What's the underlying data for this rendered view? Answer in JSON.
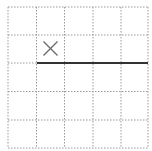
{
  "grid": {
    "rows": 5,
    "cols": 5,
    "x_lines": [
      8,
      36.5,
      64.5,
      93,
      121,
      148
    ],
    "y_lines": [
      7,
      35,
      63,
      91.5,
      120,
      148
    ],
    "line_color": "#999999",
    "dash": "1.5,1.5"
  },
  "marks": [
    {
      "type": "cross",
      "cx": 50.5,
      "cy": 48.5,
      "size": 7,
      "color": "#666666"
    }
  ],
  "segments": [
    {
      "x1": 37,
      "y1": 63,
      "x2": 148,
      "y2": 63,
      "color": "#333333",
      "width": 2
    }
  ]
}
